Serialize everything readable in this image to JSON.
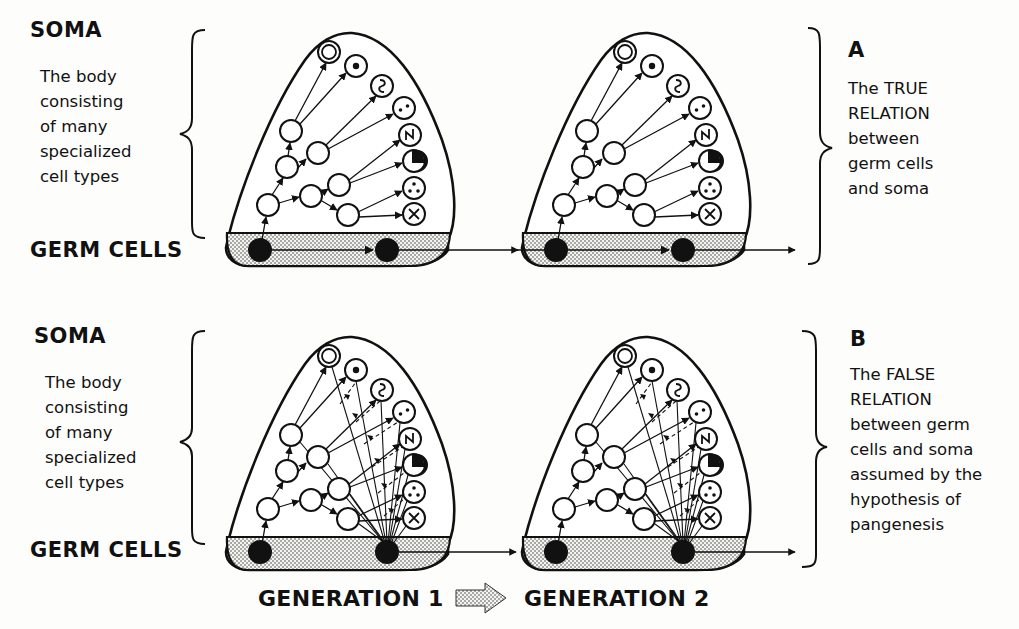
{
  "rows": [
    {
      "id": "A",
      "soma_label": "SOMA",
      "soma_desc": [
        "The body",
        "consisting",
        "of many",
        "specialized",
        "cell types"
      ],
      "germ_label": "GERM CELLS",
      "panel_letter": "A",
      "panel_desc": [
        "The TRUE",
        "RELATION",
        "between",
        "germ cells",
        "and soma"
      ]
    },
    {
      "id": "B",
      "soma_label": "SOMA",
      "soma_desc": [
        "The body",
        "consisting",
        "of many",
        "specialized",
        "cell types"
      ],
      "germ_label": "GERM CELLS",
      "panel_letter": "B",
      "panel_desc": [
        "The FALSE",
        "RELATION",
        "between  germ",
        "cells and soma",
        "assumed by the",
        "hypothesis of",
        "pangenesis"
      ]
    }
  ],
  "footer": {
    "generation_1": "GENERATION 1",
    "generation_2": "GENERATION 2"
  },
  "cell_types": [
    "double-ring",
    "dot",
    "wave",
    "two-dots",
    "zigzag",
    "half-black",
    "three-dots",
    "cross"
  ],
  "colors": {
    "ink": "#111111",
    "paper": "#fdfdfb",
    "stipple": "#9a9a9a"
  }
}
